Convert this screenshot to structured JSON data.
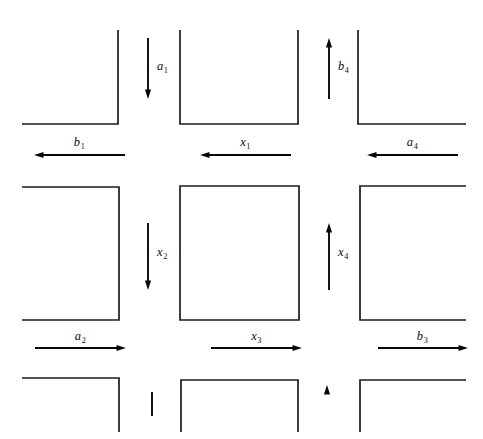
{
  "figure": {
    "type": "diagram",
    "width": 483,
    "height": 439,
    "background_color": "#ffffff",
    "line_color": "#1c1c1c",
    "arrow_color": "#080808"
  },
  "labels": {
    "a1": {
      "base": "a",
      "subscript": "1"
    },
    "b4": {
      "base": "b",
      "subscript": "4"
    },
    "b1": {
      "base": "b",
      "subscript": "1"
    },
    "x1": {
      "base": "x",
      "subscript": "1"
    },
    "a4": {
      "base": "a",
      "subscript": "4"
    },
    "x2": {
      "base": "x",
      "subscript": "2"
    },
    "x4": {
      "base": "x",
      "subscript": "4"
    },
    "a2": {
      "base": "a",
      "subscript": "2"
    },
    "x3": {
      "base": "x",
      "subscript": "3"
    },
    "b3": {
      "base": "b",
      "subscript": "3"
    }
  },
  "arrows": [
    {
      "name": "a1",
      "label": "a1",
      "direction": "down",
      "x": 148,
      "y1": 38,
      "y2": 99
    },
    {
      "name": "b4",
      "label": "b4",
      "direction": "up",
      "x": 329,
      "y1": 99,
      "y2": 38
    },
    {
      "name": "b1",
      "label": "b1",
      "direction": "left",
      "y": 155,
      "x1": 125,
      "x2": 34
    },
    {
      "name": "x1",
      "label": "x1",
      "direction": "left",
      "y": 155,
      "x1": 291,
      "x2": 200
    },
    {
      "name": "a4",
      "label": "a4",
      "direction": "left",
      "y": 155,
      "x1": 458,
      "x2": 367
    },
    {
      "name": "x2",
      "label": "x2",
      "direction": "down",
      "x": 148,
      "y1": 223,
      "y2": 290
    },
    {
      "name": "x4",
      "label": "x4",
      "direction": "up",
      "x": 329,
      "y1": 290,
      "y2": 223
    },
    {
      "name": "a2",
      "label": "a2",
      "direction": "right",
      "y": 348,
      "x1": 35,
      "x2": 126
    },
    {
      "name": "x3",
      "label": "x3",
      "direction": "right",
      "y": 348,
      "x1": 211,
      "x2": 302
    },
    {
      "name": "b3",
      "label": "b3",
      "direction": "right",
      "y": 348,
      "x1": 378,
      "x2": 468
    },
    {
      "name": "clipped-bottom-left",
      "direction": "up-clipped",
      "x": 152,
      "y1": 416,
      "y2": 390
    },
    {
      "name": "clipped-bottom-right",
      "direction": "up-clipped",
      "x": 327,
      "y1": 416,
      "y2": 386
    }
  ],
  "blocks": [
    {
      "name": "top-left",
      "shape": "corner-br",
      "path": "M 22 124 L 118 124 L 118 30"
    },
    {
      "name": "top-center",
      "shape": "open-top",
      "path": "M 180 30 L 180 124 L 298 124 L 298 30"
    },
    {
      "name": "top-right",
      "shape": "corner-bl",
      "path": "M 358 30 L 358 124 L 466 124"
    },
    {
      "name": "middle-left",
      "shape": "corner-open-left",
      "path": "M 22 187 L 119 187 L 119 320 L 22 320"
    },
    {
      "name": "middle-center",
      "shape": "rectangle",
      "path": "M 180 186 L 299 186 L 299 320 L 180 320 Z"
    },
    {
      "name": "middle-right",
      "shape": "corner-open-right",
      "path": "M 466 186 L 360 186 L 360 320 L 466 320"
    },
    {
      "name": "bottom-left",
      "shape": "corner-tr",
      "path": "M 22 378 L 119 378 L 119 432"
    },
    {
      "name": "bottom-center",
      "shape": "open-bottom",
      "path": "M 181 432 L 181 380 L 298 380 L 298 432"
    },
    {
      "name": "bottom-right",
      "shape": "corner-tl",
      "path": "M 360 432 L 360 380 L 466 380"
    }
  ]
}
